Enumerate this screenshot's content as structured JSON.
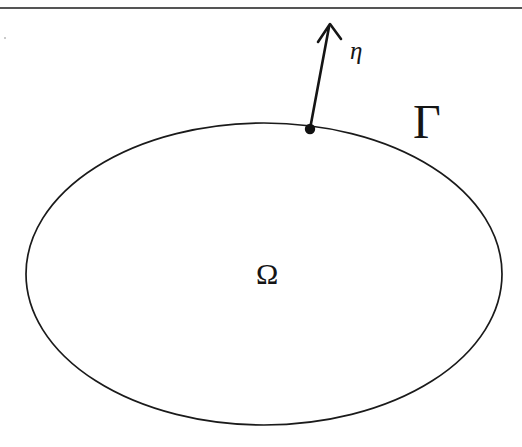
{
  "figure": {
    "caption_rule_present": true,
    "background_color": "#ffffff",
    "ink_color": "#151515",
    "rule_color": "#555555",
    "labels": {
      "boundary": "Γ",
      "domain": "Ω",
      "normal_vector": "η"
    },
    "geometry": {
      "ellipse": {
        "center_x": 264,
        "center_y": 274,
        "radius_x": 238,
        "radius_y": 151
      },
      "boundary_point": {
        "x": 310,
        "y": 129,
        "dot_radius": 5
      },
      "normal_arrow": {
        "from_x": 310,
        "from_y": 129,
        "to_x": 330,
        "to_y": 24
      },
      "top_rule": {
        "y": 8,
        "x_start": 0,
        "x_end": 522
      }
    }
  }
}
